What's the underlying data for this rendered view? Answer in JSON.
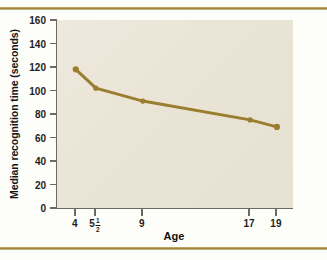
{
  "figure": {
    "rule_color": "#a78b3a",
    "plot_bg": "#eae4d6",
    "axis_color": "#6d6a63"
  },
  "chart_data": {
    "type": "line",
    "title": "",
    "xlabel": "Age",
    "ylabel": "Median recognition time (seconds)",
    "categories": [
      "4",
      "5½",
      "9",
      "17",
      "19"
    ],
    "x": [
      4,
      5.5,
      9,
      17,
      19
    ],
    "values": [
      118,
      102,
      91,
      75,
      69
    ],
    "series": [
      {
        "name": "Median recognition time",
        "values": [
          118,
          102,
          91,
          75,
          69
        ],
        "color": "#9a7d2e",
        "marker": "circle",
        "line_width": 3
      }
    ],
    "ylim": [
      0,
      160
    ],
    "yticks": [
      0,
      20,
      40,
      60,
      80,
      100,
      120,
      140,
      160
    ],
    "ytick_labels": [
      "0",
      "20",
      "40",
      "60",
      "80",
      "100",
      "120",
      "140",
      "160"
    ],
    "xticks": [
      4,
      5.5,
      9,
      17,
      19
    ],
    "xtick_labels": [
      "4",
      "5½",
      "9",
      "17",
      "19"
    ],
    "xlim": [
      2.6,
      20.2
    ],
    "grid": false,
    "legend": "none"
  }
}
